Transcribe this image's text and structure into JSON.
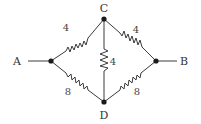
{
  "diagram": {
    "type": "resistor-bridge-circuit",
    "nodes": [
      {
        "id": "A",
        "label": "A",
        "x": 51,
        "y": 61,
        "label_x": 17,
        "label_y": 65
      },
      {
        "id": "B",
        "label": "B",
        "x": 156,
        "y": 61,
        "label_x": 184,
        "label_y": 65
      },
      {
        "id": "C",
        "label": "C",
        "x": 104,
        "y": 19,
        "label_x": 104,
        "label_y": 12
      },
      {
        "id": "D",
        "label": "D",
        "x": 104,
        "y": 102,
        "label_x": 104,
        "label_y": 119
      }
    ],
    "terminals": [
      {
        "from": "A",
        "lead_x": 28,
        "lead_y": 61
      },
      {
        "from": "B",
        "lead_x": 177,
        "lead_y": 61
      }
    ],
    "resistors": [
      {
        "id": "AC",
        "from": "A",
        "to": "C",
        "value": "4",
        "label_x": 66,
        "label_y": 31
      },
      {
        "id": "CB",
        "from": "C",
        "to": "B",
        "value": "4",
        "label_x": 136,
        "label_y": 33
      },
      {
        "id": "CD",
        "from": "C",
        "to": "D",
        "value": "4",
        "label_x": 113,
        "label_y": 65
      },
      {
        "id": "AD",
        "from": "A",
        "to": "D",
        "value": "8",
        "label_x": 68,
        "label_y": 95
      },
      {
        "id": "DB",
        "from": "D",
        "to": "B",
        "value": "8",
        "label_x": 137,
        "label_y": 95
      }
    ]
  }
}
